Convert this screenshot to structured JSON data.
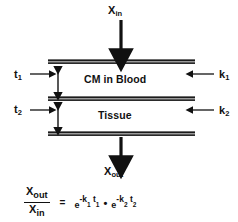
{
  "diagram": {
    "background_color": "#ffffff",
    "ink_color": "#111111",
    "bar_color": "#1b1b1b",
    "inputs": {
      "top_label_base": "X",
      "top_label_sub": "in",
      "bottom_label_base": "X",
      "bottom_label_sub": "out"
    },
    "compartments": [
      {
        "name": "blood",
        "label": "CM in Blood"
      },
      {
        "name": "tissue",
        "label": "Tissue"
      }
    ],
    "thickness_labels": [
      {
        "name": "t1",
        "base": "t",
        "sub": "1"
      },
      {
        "name": "t2",
        "base": "t",
        "sub": "2"
      }
    ],
    "coefficient_labels": [
      {
        "name": "k1",
        "base": "k",
        "sub": "1"
      },
      {
        "name": "k2",
        "base": "k",
        "sub": "2"
      }
    ],
    "equation": {
      "numerator_base": "X",
      "numerator_sub": "out",
      "denominator_base": "X",
      "denominator_sub": "in",
      "equals": "=",
      "term1_base": "e",
      "term1_exp_prefix": "-k",
      "term1_exp_sub1": "1",
      "term1_exp_mid": " t",
      "term1_exp_sub2": "1",
      "operator": "•",
      "term2_base": "e",
      "term2_exp_prefix": "-k",
      "term2_exp_sub1": "2",
      "term2_exp_mid": " t",
      "term2_exp_sub2": "2",
      "plain_text": "Xout / Xin = e^(-k1 t1) • e^(-k2 t2)"
    }
  }
}
